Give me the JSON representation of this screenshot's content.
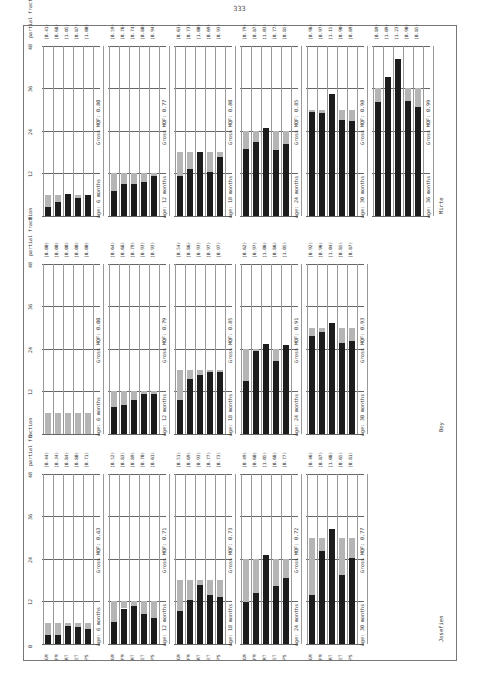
{
  "page": {
    "number": "333"
  },
  "chart_data": {
    "type": "bar",
    "orientation": "rotated-90",
    "categories": [
      "GM",
      "FM",
      "RT",
      "ET",
      "PS"
    ],
    "y_axis": {
      "ticks": [
        "0",
        "12",
        "24",
        "36",
        "48"
      ],
      "labels": [
        "0",
        "12",
        "24",
        "3 yrs 36 mts",
        "4 48"
      ],
      "unit": "months"
    },
    "column_header": "partial fraction",
    "panels": [
      {
        "name": "Mirte",
        "groups": [
          {
            "age": "Age: 6 months",
            "age_months": 6,
            "gross_mqf": "Gross MQF: 0.80",
            "partial_fractions": [
              "(0.41)",
              "(0.68)",
              "(1.05)",
              "(0.87)",
              "(1.00)"
            ],
            "values": [
              2.5,
              4,
              6.3,
              5.2,
              6
            ]
          },
          {
            "age": "Age: 12 months",
            "age_months": 12,
            "gross_mqf": "Gross MQF: 0.77",
            "partial_fractions": [
              "(0.59)",
              "(0.76)",
              "(0.74)",
              "(0.80)",
              "(0.94)"
            ],
            "values": [
              7,
              9,
              8.9,
              9.6,
              11.3
            ]
          },
          {
            "age": "Age: 18 months",
            "age_months": 18,
            "gross_mqf": "Gross MQF: 0.80",
            "partial_fractions": [
              "(0.63)",
              "(0.73)",
              "(1.00)",
              "(0.69)",
              "(0.93)"
            ],
            "values": [
              11.3,
              13.1,
              18,
              12.4,
              16.7
            ]
          },
          {
            "age": "Age: 24 months",
            "age_months": 24,
            "gross_mqf": "Gross MQF: 0.85",
            "partial_fractions": [
              "(0.79)",
              "(0.87)",
              "(1.03)",
              "(0.77)",
              "(0.85)"
            ],
            "values": [
              19,
              20.9,
              24.7,
              18.5,
              20.4
            ]
          },
          {
            "age": "Age: 30 months",
            "age_months": 30,
            "gross_mqf": "Gross MQF: 0.98",
            "partial_fractions": [
              "(0.98)",
              "(0.97)",
              "(1.15)",
              "(0.90)",
              "(0.89)"
            ],
            "values": [
              29.4,
              29.1,
              34.5,
              27,
              26.7
            ]
          },
          {
            "age": "Age: 36 months",
            "age_months": 36,
            "gross_mqf": "Gross MQF: 0.99",
            "partial_fractions": [
              "(0.89)",
              "(1.09)",
              "(1.23)",
              "(0.90)",
              "(0.85)"
            ],
            "values": [
              32,
              39.2,
              44.3,
              32.4,
              30.6
            ]
          }
        ]
      },
      {
        "name": "Boy",
        "groups": [
          {
            "age": "Age: 6 months",
            "age_months": 6,
            "gross_mqf": "Gross MQF: 0.00",
            "partial_fractions": [
              "(0.00)",
              "(0.00)",
              "(0.00)",
              "(0.00)",
              "(0.00)"
            ],
            "values": [
              0,
              0,
              0,
              0,
              0
            ]
          },
          {
            "age": "Age: 12 months",
            "age_months": 12,
            "gross_mqf": "Gross MQF: 0.79",
            "partial_fractions": [
              "(0.64)",
              "(0.68)",
              "(0.79)",
              "(0.93)",
              "(0.93)"
            ],
            "values": [
              7.7,
              8.2,
              9.5,
              11.2,
              11.2
            ]
          },
          {
            "age": "Age: 18 months",
            "age_months": 18,
            "gross_mqf": "Gross MQF: 0.85",
            "partial_fractions": [
              "(0.54)",
              "(0.86)",
              "(0.93)",
              "(0.97)",
              "(0.97)"
            ],
            "values": [
              9.7,
              15.5,
              16.7,
              17.5,
              17.5
            ]
          },
          {
            "age": "Age: 24 months",
            "age_months": 24,
            "gross_mqf": "Gross MQF: 0.91",
            "partial_fractions": [
              "(0.62)",
              "(0.97)",
              "(1.06)",
              "(0.86)",
              "(1.05)"
            ],
            "values": [
              14.9,
              23.3,
              25.4,
              20.6,
              25.2
            ]
          },
          {
            "age": "Age: 30 months",
            "age_months": 30,
            "gross_mqf": "Gross MQF: 0.93",
            "partial_fractions": [
              "(0.92)",
              "(0.96)",
              "(1.04)",
              "(0.85)",
              "(0.87)"
            ],
            "values": [
              27.6,
              28.8,
              31.2,
              25.5,
              26.1
            ]
          }
        ]
      },
      {
        "name": "Josefien",
        "groups": [
          {
            "age": "Age: 6 months",
            "age_months": 6,
            "gross_mqf": "Gross MQF: 0.63",
            "partial_fractions": [
              "(0.44)",
              "(0.34)",
              "(0.84)",
              "(0.80)",
              "(0.71)"
            ],
            "values": [
              2.6,
              2.5,
              5,
              4.8,
              4.3
            ]
          },
          {
            "age": "Age: 12 months",
            "age_months": 12,
            "gross_mqf": "Gross MQF: 0.71",
            "partial_fractions": [
              "(0.52)",
              "(0.83)",
              "(0.89)",
              "(0.70)",
              "(0.61)"
            ],
            "values": [
              6.2,
              10,
              10.7,
              8.4,
              7.3
            ]
          },
          {
            "age": "Age: 18 months",
            "age_months": 18,
            "gross_mqf": "Gross MQF: 0.73",
            "partial_fractions": [
              "(0.51)",
              "(0.69)",
              "(0.93)",
              "(0.77)",
              "(0.73)"
            ],
            "values": [
              9.2,
              12.4,
              16.7,
              13.9,
              13.1
            ]
          },
          {
            "age": "Age: 24 months",
            "age_months": 24,
            "gross_mqf": "Gross MQF: 0.72",
            "partial_fractions": [
              "(0.49)",
              "(0.60)",
              "(1.05)",
              "(0.68)",
              "(0.77)"
            ],
            "values": [
              11.8,
              14.4,
              25.2,
              16.3,
              18.5
            ]
          },
          {
            "age": "Age: 30 months",
            "age_months": 30,
            "gross_mqf": "Gross MQF: 0.77",
            "partial_fractions": [
              "(0.46)",
              "(0.87)",
              "(1.08)",
              "(0.65)",
              "(0.81)"
            ],
            "values": [
              13.8,
              26.1,
              32.4,
              19.5,
              24.3
            ]
          }
        ]
      }
    ],
    "legend": {
      "dark": "developmental age reached",
      "light": "chronological age"
    },
    "grid": true
  }
}
